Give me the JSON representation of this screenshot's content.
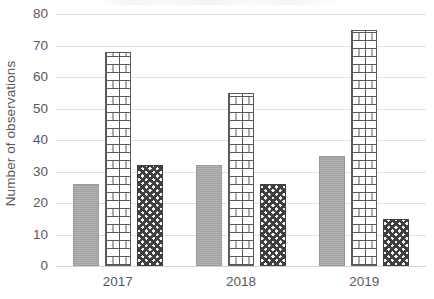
{
  "chart_data": {
    "type": "bar",
    "title": "",
    "subtitle": "",
    "xlabel": "",
    "ylabel": "Number of observations",
    "categories": [
      "2017",
      "2018",
      "2019"
    ],
    "series": [
      {
        "name": "Series 1",
        "pattern": "solid-gray",
        "color": "#a6a6a6",
        "values": [
          26,
          32,
          35
        ]
      },
      {
        "name": "Series 2",
        "pattern": "brick",
        "color": "#ffffff",
        "values": [
          68,
          55,
          75
        ]
      },
      {
        "name": "Series 3",
        "pattern": "checker",
        "color": "#3f3f3f",
        "values": [
          32,
          26,
          15
        ]
      }
    ],
    "ylim": [
      0,
      80
    ],
    "ytick_labels": [
      "80",
      "70",
      "60",
      "50",
      "40",
      "30",
      "20",
      "10",
      "0"
    ],
    "ytick_values": [
      80,
      70,
      60,
      50,
      40,
      30,
      20,
      10,
      0
    ],
    "ytick_step": 10,
    "grid": true,
    "grid_axis": "y",
    "legend": "none",
    "background_color": "#ffffff",
    "gridline_color": "#e2e2e2",
    "text_color": "#595959"
  }
}
